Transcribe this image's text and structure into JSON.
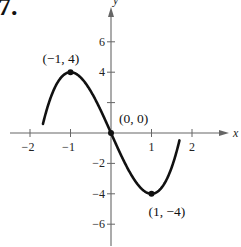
{
  "problem_number": "7.",
  "chart_data": {
    "type": "line",
    "title": "",
    "function": "f(x) = 2x^3 - 6x",
    "xlabel": "x",
    "ylabel": "y",
    "xlim": [
      -2.7,
      3.0
    ],
    "ylim": [
      -7.5,
      8.5
    ],
    "grid": false,
    "x_ticks": [
      -2,
      -1,
      1,
      2
    ],
    "x_tick_labels": [
      "−2",
      "−1",
      "1",
      "2"
    ],
    "y_ticks": [
      -6,
      -4,
      -2,
      2,
      4,
      6
    ],
    "y_tick_labels": [
      "−6",
      "−4",
      "−2",
      "",
      "4",
      "6"
    ],
    "series": [
      {
        "name": "curve",
        "x": [
          -1.7,
          -1.5,
          -1.25,
          -1.0,
          -0.75,
          -0.5,
          -0.25,
          0.0,
          0.25,
          0.5,
          0.75,
          1.0,
          1.25,
          1.5,
          1.7
        ],
        "y": [
          0.4,
          2.25,
          3.59,
          4.0,
          3.66,
          2.75,
          1.47,
          0.0,
          -1.47,
          -2.75,
          -3.66,
          -4.0,
          -3.59,
          -2.25,
          -0.4
        ]
      }
    ],
    "annotations": [
      {
        "label": "(−1, 4)",
        "x": -1,
        "y": 4,
        "kind": "relative maximum"
      },
      {
        "label": "(0, 0)",
        "x": 0,
        "y": 0,
        "kind": "point of inflection"
      },
      {
        "label": "(1, −4)",
        "x": 1,
        "y": -4,
        "kind": "relative minimum"
      }
    ]
  },
  "colors": {
    "curve": "#111111",
    "axes": "#666666",
    "text": "#222222",
    "background": "#ffffff"
  }
}
